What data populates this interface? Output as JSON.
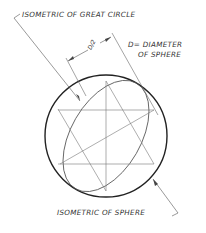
{
  "labels": {
    "great_circle": "ISOMETRIC OF GREAT CIRCLE",
    "diameter_line1": "D= DIAMETER",
    "diameter_line2": "OF SPHERE",
    "sphere": "ISOMETRIC OF SPHERE",
    "half_d": "D/2"
  },
  "colors": {
    "line": "#444444",
    "outline": "#222222",
    "background": "#ffffff"
  }
}
